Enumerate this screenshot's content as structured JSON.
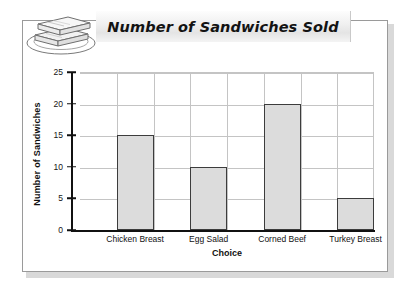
{
  "banner": {
    "title": "Number of Sandwiches Sold",
    "icon": "sandwich-on-plate-icon"
  },
  "chart_data": {
    "type": "bar",
    "title": "Number of Sandwiches Sold",
    "xlabel": "Choice",
    "ylabel": "Number of Sandwiches",
    "categories": [
      "Chicken Breast",
      "Egg Salad",
      "Corned Beef",
      "Turkey Breast"
    ],
    "values": [
      15,
      10,
      20,
      5
    ],
    "ylim": [
      0,
      25
    ],
    "yticks": [
      0,
      5,
      10,
      15,
      20,
      25
    ],
    "ytick_labels": [
      "0",
      "5",
      "10",
      "15",
      "20",
      "25"
    ],
    "grid": true,
    "legend": false,
    "bar_fill": "#dcdcdc",
    "bar_border": "#3c3c3c",
    "grid_color": "#c4c4c4",
    "axis_color": "#111111"
  }
}
